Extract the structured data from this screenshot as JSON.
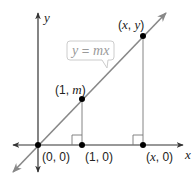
{
  "diagram": {
    "axes": {
      "x_label": "x",
      "y_label": "y",
      "color": "#333333"
    },
    "line": {
      "equation_label": "y = mx",
      "color": "#888888"
    },
    "points": [
      {
        "id": "origin",
        "label": "(0, 0)",
        "color": "#000000"
      },
      {
        "id": "one-zero",
        "label": "(1, 0)",
        "color": "#000000"
      },
      {
        "id": "one-m",
        "label": "(1, m)",
        "color": "#000000"
      },
      {
        "id": "x-zero",
        "label": "(x, 0)",
        "color": "#000000"
      },
      {
        "id": "x-y",
        "label": "(x, y)",
        "color": "#000000"
      }
    ],
    "label_parts": {
      "origin": {
        "open": "(0, 0)"
      },
      "one_zero": {
        "open": "(1, 0)"
      },
      "one_m": {
        "prefix": "(1, ",
        "var": "m",
        "suffix": ")"
      },
      "x_zero": {
        "prefix": "(",
        "var": "x",
        "suffix": ", 0)"
      },
      "x_y": {
        "prefix": "(",
        "var1": "x",
        "mid": ", ",
        "var2": "y",
        "suffix": ")"
      },
      "callout": {
        "var1": "y",
        "eq": " = ",
        "var2": "mx"
      }
    },
    "callout_border_color": "#cccccc",
    "right_angle_marks": 2
  }
}
